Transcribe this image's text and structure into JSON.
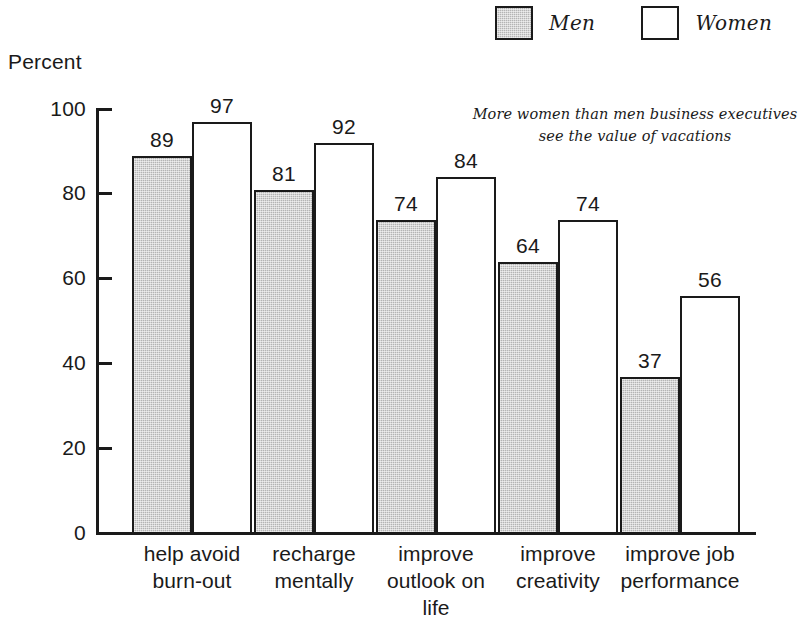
{
  "chart_data": {
    "type": "bar",
    "title": "",
    "annotation": [
      "More women than men business executives",
      "see the value of vacations"
    ],
    "xlabel": "",
    "ylabel": "Percent",
    "ylim": [
      0,
      100
    ],
    "yticks": [
      0,
      20,
      40,
      60,
      80,
      100
    ],
    "grid": false,
    "legend_position": "top-right",
    "categories": [
      [
        "help avoid",
        "burn-out"
      ],
      [
        "recharge",
        "mentally"
      ],
      [
        "improve",
        "outlook on",
        "life"
      ],
      [
        "improve",
        "creativity"
      ],
      [
        "improve job",
        "performance"
      ]
    ],
    "series": [
      {
        "name": "Men",
        "color": "#b4b4b4",
        "values": [
          89,
          81,
          74,
          64,
          37
        ]
      },
      {
        "name": "Women",
        "color": "#ffffff",
        "values": [
          97,
          92,
          84,
          74,
          56
        ]
      }
    ]
  },
  "legend": {
    "items": [
      {
        "label": "Men",
        "swatch": "men"
      },
      {
        "label": "Women",
        "swatch": "women"
      }
    ]
  },
  "axis": {
    "y_title": "Percent",
    "y_ticks": [
      "0",
      "20",
      "40",
      "60",
      "80",
      "100"
    ]
  },
  "values": {
    "men": [
      "89",
      "81",
      "74",
      "64",
      "37"
    ],
    "women": [
      "97",
      "92",
      "84",
      "74",
      "56"
    ]
  },
  "categories": [
    {
      "line1": "help avoid",
      "line2": "burn-out",
      "line3": ""
    },
    {
      "line1": "recharge",
      "line2": "mentally",
      "line3": ""
    },
    {
      "line1": "improve",
      "line2": "outlook on",
      "line3": "life"
    },
    {
      "line1": "improve",
      "line2": "creativity",
      "line3": ""
    },
    {
      "line1": "improve job",
      "line2": "performance",
      "line3": ""
    }
  ],
  "colors": {
    "men_fill": "#b4b4b4",
    "women_fill": "#ffffff",
    "ink": "#1a1a1a"
  }
}
